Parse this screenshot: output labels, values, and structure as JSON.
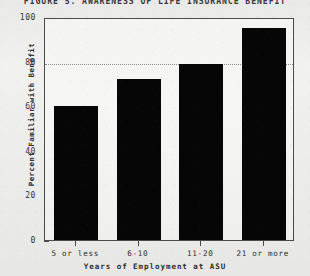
{
  "chart_data": {
    "type": "bar",
    "title": "FIGURE 5.  AWARENESS OF LIFE INSURANCE BENEFIT",
    "xlabel": "Years of Employment at ASU",
    "ylabel": "Percent Familiar with Benefit",
    "categories": [
      "5 or less",
      "6-10",
      "11-20",
      "21 or more"
    ],
    "values": [
      60,
      72,
      79,
      95
    ],
    "series": [
      {
        "name": "Percent Familiar with Benefit",
        "values": [
          60,
          72,
          79,
          95
        ]
      }
    ],
    "ylim": [
      0,
      100
    ],
    "y_ticks": [
      0,
      20,
      40,
      60,
      80,
      100
    ],
    "y_tick_labels": [
      "0",
      "20",
      "40",
      "60",
      "80",
      "100"
    ],
    "y_minor_ticks": [
      10,
      30,
      50,
      70,
      90
    ],
    "gridlines": [
      80
    ],
    "grid": "horizontal-dotted-at-80",
    "legend": "none",
    "legend_position": "none",
    "bar_color": "#060606",
    "background_color": "#eeeeec",
    "axis_color": "#4a4a4a"
  },
  "figure": {
    "frame": "rectangular-box",
    "bar_count": 4
  }
}
